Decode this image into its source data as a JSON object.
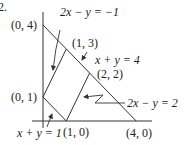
{
  "problem_number": "2.",
  "diagram": {
    "vertices": [
      {
        "label": "(0, 4)",
        "x": 0,
        "y": 4
      },
      {
        "label": "(1, 3)",
        "x": 1,
        "y": 3
      },
      {
        "label": "(2, 2)",
        "x": 2,
        "y": 2
      },
      {
        "label": "(0, 1)",
        "x": 0,
        "y": 1
      },
      {
        "label": "(1, 0)",
        "x": 1,
        "y": 0
      },
      {
        "label": "(4, 0)",
        "x": 4,
        "y": 0
      }
    ],
    "lines": [
      {
        "equation": "x + y = 4",
        "from": [
          0,
          4
        ],
        "to": [
          4,
          0
        ]
      },
      {
        "equation": "2x − y = −1",
        "from": [
          0,
          1
        ],
        "to": [
          1,
          3
        ]
      },
      {
        "equation": "2x − y = 2",
        "from": [
          1,
          0
        ],
        "to": [
          2,
          2
        ]
      },
      {
        "equation": "x + y = 1",
        "from": [
          0,
          1
        ],
        "to": [
          1,
          0
        ]
      }
    ],
    "line_labels": {
      "l1": "2x − y = −1",
      "l2": "x + y = 4",
      "l3": "2x − y = 2",
      "l4": "x + y = 1"
    },
    "colors": {
      "stroke": "#333333",
      "text": "#222222",
      "background": "#ffffff"
    }
  }
}
